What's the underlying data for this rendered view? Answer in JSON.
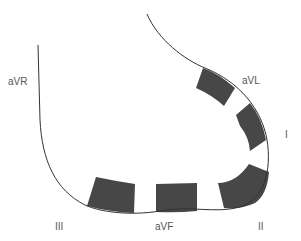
{
  "diagram": {
    "labels": {
      "avr": "aVR",
      "avl": "aVL",
      "i": "I",
      "ii": "II",
      "iii": "III",
      "avf": "aVF"
    },
    "colors": {
      "line": "#333333",
      "segment_fill": "#474747",
      "label": "#555555",
      "background": "#ffffff"
    },
    "segments": [
      "aVL",
      "I",
      "II",
      "aVF",
      "III"
    ]
  }
}
